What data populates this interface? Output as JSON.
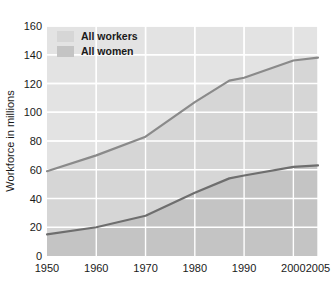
{
  "chart_data": {
    "type": "area",
    "title": "",
    "subtitle": "",
    "xlabel": "",
    "ylabel": "Workforce in millions",
    "xlim": [
      1950,
      2005
    ],
    "ylim": [
      0,
      160
    ],
    "grid": true,
    "legend_position": "top-left",
    "x": [
      1950,
      1960,
      1970,
      1980,
      1987,
      1990,
      2000,
      2005
    ],
    "xticks": [
      "1950",
      "1960",
      "1970",
      "1980",
      "1990",
      "2000",
      "2005"
    ],
    "xtick_values": [
      1950,
      1960,
      1970,
      1980,
      1990,
      2000,
      2005
    ],
    "yticks": [
      "0",
      "20",
      "40",
      "60",
      "80",
      "100",
      "120",
      "140",
      "160"
    ],
    "ytick_values": [
      0,
      20,
      40,
      60,
      80,
      100,
      120,
      140,
      160
    ],
    "series": [
      {
        "name": "All workers",
        "color": "#d6d6d6",
        "line_color": "#8a8a8a",
        "values": [
          59,
          70,
          83,
          107,
          122,
          124,
          136,
          138
        ]
      },
      {
        "name": "All women",
        "color": "#c4c4c4",
        "line_color": "#6e6e6e",
        "values": [
          15,
          20,
          28,
          44,
          54,
          56,
          62,
          63
        ]
      }
    ]
  },
  "legend": {
    "items": [
      {
        "label": "All workers",
        "swatch_color": "#d6d6d6"
      },
      {
        "label": "All women",
        "swatch_color": "#c4c4c4"
      }
    ]
  },
  "axes": {
    "y_title": "Workforce in millions",
    "y_labels": [
      "160",
      "140",
      "120",
      "100",
      "80",
      "60",
      "40",
      "20",
      "0"
    ],
    "x_labels": [
      "1950",
      "1960",
      "1970",
      "1980",
      "1990",
      "2000",
      "2005"
    ]
  },
  "colors": {
    "background": "#ffffff",
    "plot_background": "#e3e3e3",
    "gridline": "#ffffff",
    "workers_fill": "#d6d6d6",
    "women_fill": "#c4c4c4",
    "workers_line": "#8a8a8a",
    "women_line": "#6e6e6e",
    "text": "#1a1a1a"
  }
}
